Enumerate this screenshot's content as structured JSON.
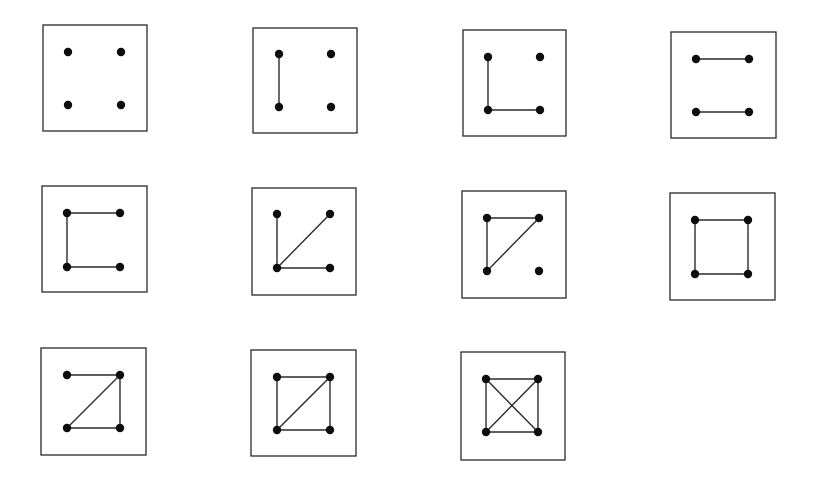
{
  "diagram": {
    "type": "graph-enumeration",
    "colors": {
      "background": "#ffffff",
      "frame_stroke": "#2a2a2a",
      "edge_stroke": "#2b2b2b",
      "vertex_fill": "#0d0d0d"
    },
    "vertex_radius": 4.2,
    "vertex_labels": [
      "TL",
      "TR",
      "BL",
      "BR"
    ],
    "graphs": [
      {
        "id": 1,
        "frame": {
          "x1": 43,
          "y1": 25,
          "x2": 147,
          "y2": 131
        },
        "vertices": {
          "TL": [
            68,
            52
          ],
          "TR": [
            121,
            52
          ],
          "BL": [
            68,
            105
          ],
          "BR": [
            121,
            105
          ]
        },
        "edges": [],
        "edge_count": 0
      },
      {
        "id": 2,
        "frame": {
          "x1": 253,
          "y1": 28,
          "x2": 357,
          "y2": 133
        },
        "vertices": {
          "TL": [
            279,
            54
          ],
          "TR": [
            331,
            54
          ],
          "BL": [
            279,
            107
          ],
          "BR": [
            331,
            107
          ]
        },
        "edges": [
          [
            "TL",
            "BL"
          ]
        ],
        "edge_count": 1
      },
      {
        "id": 3,
        "frame": {
          "x1": 463,
          "y1": 30,
          "x2": 566,
          "y2": 136
        },
        "vertices": {
          "TL": [
            488,
            57
          ],
          "TR": [
            540,
            57
          ],
          "BL": [
            488,
            110
          ],
          "BR": [
            540,
            110
          ]
        },
        "edges": [
          [
            "TL",
            "BL"
          ],
          [
            "BL",
            "BR"
          ]
        ],
        "edge_count": 2
      },
      {
        "id": 4,
        "frame": {
          "x1": 671,
          "y1": 32,
          "x2": 776,
          "y2": 138
        },
        "vertices": {
          "TL": [
            696,
            59
          ],
          "TR": [
            749,
            59
          ],
          "BL": [
            696,
            112
          ],
          "BR": [
            749,
            112
          ]
        },
        "edges": [
          [
            "TL",
            "TR"
          ],
          [
            "BL",
            "BR"
          ]
        ],
        "edge_count": 2
      },
      {
        "id": 5,
        "frame": {
          "x1": 42,
          "y1": 186,
          "x2": 147,
          "y2": 292
        },
        "vertices": {
          "TL": [
            67,
            213
          ],
          "TR": [
            120,
            213
          ],
          "BL": [
            67,
            267
          ],
          "BR": [
            120,
            267
          ]
        },
        "edges": [
          [
            "TL",
            "TR"
          ],
          [
            "TL",
            "BL"
          ],
          [
            "BL",
            "BR"
          ]
        ],
        "edge_count": 3
      },
      {
        "id": 6,
        "frame": {
          "x1": 252,
          "y1": 188,
          "x2": 356,
          "y2": 295
        },
        "vertices": {
          "TL": [
            277,
            214
          ],
          "TR": [
            330,
            214
          ],
          "BL": [
            277,
            268
          ],
          "BR": [
            330,
            268
          ]
        },
        "edges": [
          [
            "TL",
            "BL"
          ],
          [
            "BL",
            "TR"
          ],
          [
            "BL",
            "BR"
          ]
        ],
        "edge_count": 3
      },
      {
        "id": 7,
        "frame": {
          "x1": 462,
          "y1": 191,
          "x2": 566,
          "y2": 298
        },
        "vertices": {
          "TL": [
            487,
            218
          ],
          "TR": [
            539,
            218
          ],
          "BL": [
            487,
            271
          ],
          "BR": [
            539,
            271
          ]
        },
        "edges": [
          [
            "TL",
            "TR"
          ],
          [
            "TL",
            "BL"
          ],
          [
            "BL",
            "TR"
          ]
        ],
        "edge_count": 3
      },
      {
        "id": 8,
        "frame": {
          "x1": 670,
          "y1": 193,
          "x2": 775,
          "y2": 300
        },
        "vertices": {
          "TL": [
            695,
            220
          ],
          "TR": [
            748,
            220
          ],
          "BL": [
            695,
            274
          ],
          "BR": [
            748,
            274
          ]
        },
        "edges": [
          [
            "TL",
            "TR"
          ],
          [
            "TR",
            "BR"
          ],
          [
            "BR",
            "BL"
          ],
          [
            "BL",
            "TL"
          ]
        ],
        "edge_count": 4
      },
      {
        "id": 9,
        "frame": {
          "x1": 41,
          "y1": 348,
          "x2": 146,
          "y2": 455
        },
        "vertices": {
          "TL": [
            67,
            375
          ],
          "TR": [
            120,
            375
          ],
          "BL": [
            67,
            428
          ],
          "BR": [
            120,
            428
          ]
        },
        "edges": [
          [
            "TL",
            "TR"
          ],
          [
            "TR",
            "BR"
          ],
          [
            "BL",
            "BR"
          ],
          [
            "BL",
            "TR"
          ]
        ],
        "edge_count": 4
      },
      {
        "id": 10,
        "frame": {
          "x1": 251,
          "y1": 350,
          "x2": 356,
          "y2": 456
        },
        "vertices": {
          "TL": [
            277,
            377
          ],
          "TR": [
            330,
            377
          ],
          "BL": [
            277,
            430
          ],
          "BR": [
            330,
            430
          ]
        },
        "edges": [
          [
            "TL",
            "TR"
          ],
          [
            "TR",
            "BR"
          ],
          [
            "BR",
            "BL"
          ],
          [
            "BL",
            "TL"
          ],
          [
            "BL",
            "TR"
          ]
        ],
        "edge_count": 5
      },
      {
        "id": 11,
        "frame": {
          "x1": 461,
          "y1": 352,
          "x2": 565,
          "y2": 460
        },
        "vertices": {
          "TL": [
            486,
            379
          ],
          "TR": [
            538,
            379
          ],
          "BL": [
            486,
            432
          ],
          "BR": [
            538,
            432
          ]
        },
        "edges": [
          [
            "TL",
            "TR"
          ],
          [
            "TR",
            "BR"
          ],
          [
            "BR",
            "BL"
          ],
          [
            "BL",
            "TL"
          ],
          [
            "TL",
            "BR"
          ],
          [
            "BL",
            "TR"
          ]
        ],
        "edge_count": 6
      }
    ]
  }
}
